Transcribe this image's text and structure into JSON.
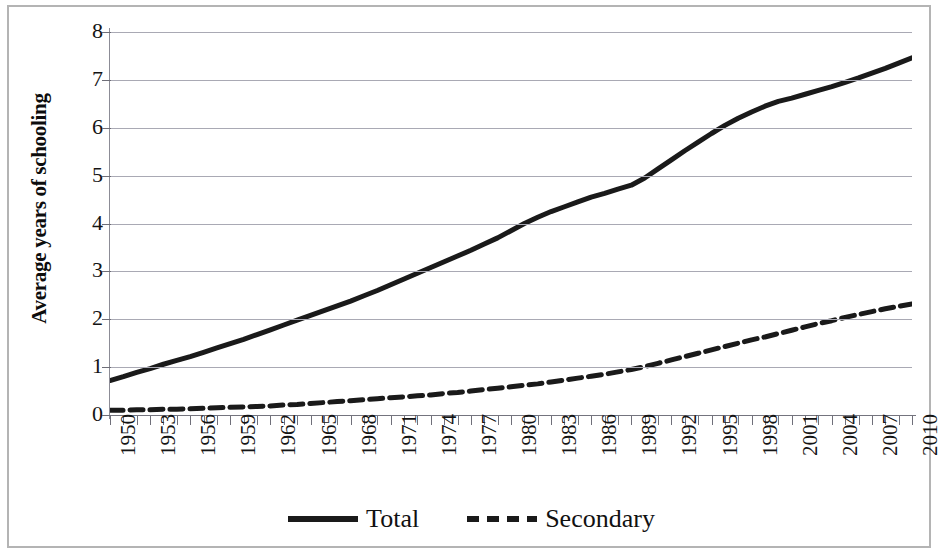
{
  "chart_data": {
    "type": "line",
    "title": "",
    "xlabel": "",
    "ylabel": "Average years of schooling",
    "xlim": [
      1950,
      2010
    ],
    "ylim": [
      0,
      8
    ],
    "ytick_labels": [
      "0",
      "1",
      "2",
      "3",
      "4",
      "5",
      "6",
      "7",
      "8"
    ],
    "ytick_values": [
      0,
      1,
      2,
      3,
      4,
      5,
      6,
      7,
      8
    ],
    "xtick_labels": [
      "1950",
      "1953",
      "1956",
      "1959",
      "1962",
      "1965",
      "1968",
      "1971",
      "1974",
      "1977",
      "1980",
      "1983",
      "1986",
      "1989",
      "1992",
      "1995",
      "1998",
      "2001",
      "2004",
      "2007",
      "2010"
    ],
    "xtick_label_values": [
      1950,
      1953,
      1956,
      1959,
      1962,
      1965,
      1968,
      1971,
      1974,
      1977,
      1980,
      1983,
      1986,
      1989,
      1992,
      1995,
      1998,
      2001,
      2004,
      2007,
      2010
    ],
    "minor_tick_interval": 1,
    "grid": "horizontal",
    "legend_position": "bottom-center",
    "x": [
      1950,
      1951,
      1952,
      1953,
      1954,
      1955,
      1956,
      1957,
      1958,
      1959,
      1960,
      1961,
      1962,
      1963,
      1964,
      1965,
      1966,
      1967,
      1968,
      1969,
      1970,
      1971,
      1972,
      1973,
      1974,
      1975,
      1976,
      1977,
      1978,
      1979,
      1980,
      1981,
      1982,
      1983,
      1984,
      1985,
      1986,
      1987,
      1988,
      1989,
      1990,
      1991,
      1992,
      1993,
      1994,
      1995,
      1996,
      1997,
      1998,
      1999,
      2000,
      2001,
      2002,
      2003,
      2004,
      2005,
      2006,
      2007,
      2008,
      2009,
      2010
    ],
    "series": [
      {
        "name": "Total",
        "style": "solid",
        "color": "#1a1a1a",
        "width": 5,
        "values": [
          0.72,
          0.8,
          0.89,
          0.97,
          1.06,
          1.14,
          1.22,
          1.31,
          1.4,
          1.49,
          1.58,
          1.68,
          1.78,
          1.88,
          1.98,
          2.08,
          2.18,
          2.28,
          2.38,
          2.49,
          2.6,
          2.72,
          2.84,
          2.96,
          3.08,
          3.2,
          3.32,
          3.44,
          3.57,
          3.7,
          3.85,
          4.0,
          4.13,
          4.25,
          4.35,
          4.45,
          4.55,
          4.63,
          4.72,
          4.8,
          4.95,
          5.14,
          5.33,
          5.52,
          5.7,
          5.88,
          6.05,
          6.2,
          6.33,
          6.45,
          6.55,
          6.62,
          6.7,
          6.78,
          6.86,
          6.95,
          7.04,
          7.14,
          7.24,
          7.35,
          7.46
        ]
      },
      {
        "name": "Secondary",
        "style": "dashed",
        "color": "#1a1a1a",
        "width": 5,
        "values": [
          0.1,
          0.1,
          0.11,
          0.11,
          0.12,
          0.12,
          0.13,
          0.14,
          0.15,
          0.16,
          0.17,
          0.18,
          0.19,
          0.21,
          0.22,
          0.24,
          0.26,
          0.28,
          0.3,
          0.32,
          0.34,
          0.36,
          0.38,
          0.4,
          0.42,
          0.45,
          0.47,
          0.5,
          0.53,
          0.56,
          0.59,
          0.62,
          0.65,
          0.69,
          0.73,
          0.77,
          0.81,
          0.85,
          0.9,
          0.95,
          1.01,
          1.08,
          1.15,
          1.22,
          1.29,
          1.36,
          1.43,
          1.5,
          1.57,
          1.63,
          1.7,
          1.77,
          1.84,
          1.91,
          1.97,
          2.04,
          2.1,
          2.16,
          2.22,
          2.27,
          2.32
        ]
      }
    ]
  },
  "legend": {
    "items": [
      {
        "label": "Total"
      },
      {
        "label": "Secondary"
      }
    ]
  }
}
